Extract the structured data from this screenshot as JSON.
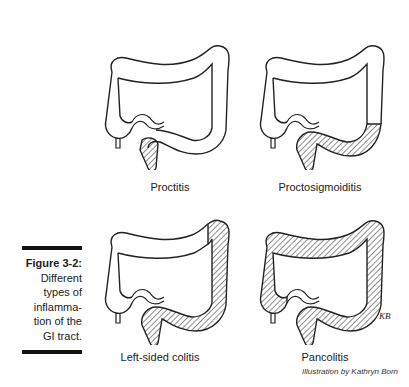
{
  "figure": {
    "number": "Figure 3-2:",
    "caption_lines": [
      "Different",
      "types of",
      "inflamma-",
      "tion of the",
      "GI tract."
    ],
    "credit": "Illustration by Kathryn Born",
    "signature": "KB"
  },
  "panels": [
    {
      "label": "Proctitis",
      "shaded": "rectum"
    },
    {
      "label": "Proctosigmoiditis",
      "shaded": "rectum-sigmoid"
    },
    {
      "label": "Left-sided colitis",
      "shaded": "left-colon"
    },
    {
      "label": "Pancolitis",
      "shaded": "entire-colon"
    }
  ],
  "colors": {
    "ink": "#222222",
    "background": "#ffffff",
    "bar": "#111111"
  }
}
